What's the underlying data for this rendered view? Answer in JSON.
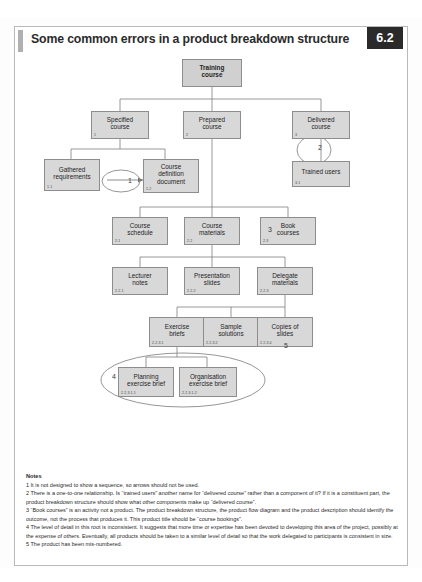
{
  "header": {
    "title": "Some common errors in a product breakdown structure",
    "badge": "6.2"
  },
  "diagram": {
    "nodes": [
      {
        "id": "root",
        "label": "Training\ncourse",
        "code": ""
      },
      {
        "id": "n1",
        "label": "Specified\ncourse",
        "code": "1"
      },
      {
        "id": "n2",
        "label": "Prepared\ncourse",
        "code": "2"
      },
      {
        "id": "n3",
        "label": "Delivered\ncourse",
        "code": "3"
      },
      {
        "id": "n11",
        "label": "Gathered\nrequirements",
        "code": "1.1"
      },
      {
        "id": "n12",
        "label": "Course\ndefinition\ndocument",
        "code": "1.2"
      },
      {
        "id": "n31",
        "label": "Trained users",
        "code": "3.1"
      },
      {
        "id": "n21",
        "label": "Course\nschedule",
        "code": "2.1"
      },
      {
        "id": "n22",
        "label": "Course\nmaterials",
        "code": "2.2"
      },
      {
        "id": "n23",
        "label": "Book\ncourses",
        "code": "2.3"
      },
      {
        "id": "n221",
        "label": "Lecturer\nnotes",
        "code": "2.2.1"
      },
      {
        "id": "n222",
        "label": "Presentation\nslides",
        "code": "2.2.2"
      },
      {
        "id": "n223",
        "label": "Delegate\nmaterials",
        "code": "2.2.3"
      },
      {
        "id": "n2231",
        "label": "Exercise\nbriefs",
        "code": "2.2.3.1"
      },
      {
        "id": "n2232",
        "label": "Sample\nsolutions",
        "code": "2.2.3.2"
      },
      {
        "id": "n2234",
        "label": "Copies of\nslides",
        "code": "2.2.3.4"
      },
      {
        "id": "n22311",
        "label": "Planning\nexercise brief",
        "code": "2.2.3.1.1"
      },
      {
        "id": "n22312",
        "label": "Organisation\nexercise brief",
        "code": "2.2.3.1.2"
      }
    ],
    "annotations": [
      {
        "id": "a1",
        "label": "1"
      },
      {
        "id": "a2",
        "label": "2"
      },
      {
        "id": "a3",
        "label": "3"
      },
      {
        "id": "a4",
        "label": "4"
      },
      {
        "id": "a5",
        "label": "5"
      }
    ]
  },
  "notes": {
    "heading": "Notes",
    "items": [
      "1 It is not designed to show a sequence, so arrows should not be used.",
      "2 There is a one-to-one relationship. Is “trained users” another name for “delivered course” rather than a component of it? If it is a constituent part, the product breakdown structure should show what other components make up “delivered course”.",
      "3 “Book courses” is an activity not a product. The product breakdown structure, the product flow diagram and the product description should identify the outcome, not the process that produces it. This product title should be “course bookings”.",
      "4 The level of detail in this root is inconsistent. It suggests that more time or expertise has been devoted to developing this area of the project, possibly at the expense of others. Eventually, all products should be taken to a similar level of detail so that the work delegated to participants is consistent in size.",
      "5 The product has been mis-numbered."
    ]
  },
  "colors": {
    "node_fill": "#d8d8d8",
    "node_stroke": "#8d8d8d",
    "badge_bg": "#2a2a2a",
    "frame_border": "#b9b9b9"
  }
}
